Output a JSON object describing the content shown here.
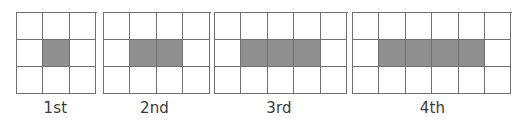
{
  "diagram": {
    "colors": {
      "grid_line": "#707070",
      "shaded": "#8f8f8f",
      "unshaded": "#ffffff",
      "label": "#3a3a3a"
    },
    "figures": [
      {
        "label": "1st",
        "rows": 3,
        "cols": 3,
        "shaded_row": 2,
        "shaded_cols": [
          2
        ]
      },
      {
        "label": "2nd",
        "rows": 3,
        "cols": 4,
        "shaded_row": 2,
        "shaded_cols": [
          2,
          3
        ]
      },
      {
        "label": "3rd",
        "rows": 3,
        "cols": 5,
        "shaded_row": 2,
        "shaded_cols": [
          2,
          3,
          4
        ]
      },
      {
        "label": "4th",
        "rows": 3,
        "cols": 6,
        "shaded_row": 2,
        "shaded_cols": [
          2,
          3,
          4,
          5
        ]
      }
    ]
  }
}
